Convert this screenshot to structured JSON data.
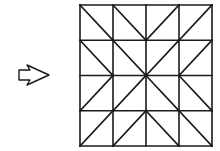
{
  "diagram": {
    "arrow": {
      "direction": "right",
      "style": "outline",
      "icon": "right-arrow-outline"
    },
    "grid": {
      "rows": 4,
      "cols": 4,
      "line_color": "#1a1a1a",
      "background": "#ffffff",
      "diagonals": [
        [
          "\\",
          "\\",
          "/",
          "/"
        ],
        [
          "\\",
          "\\",
          "/",
          "/"
        ],
        [
          "/",
          "/",
          "\\",
          "\\"
        ],
        [
          "/",
          "/",
          "\\",
          "\\"
        ]
      ],
      "description": "4x4 square grid where each cell has one diagonal, all diagonals radiating from the center point"
    }
  }
}
